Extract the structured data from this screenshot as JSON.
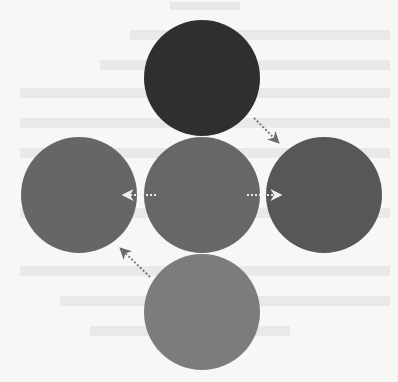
{
  "diagram": {
    "type": "color-mixing-node-diagram",
    "nodes": [
      {
        "id": "top",
        "cx": 202,
        "cy": 78,
        "r": 58,
        "color": "#2f2f2f"
      },
      {
        "id": "left",
        "cx": 79,
        "cy": 195,
        "r": 58,
        "color": "#666666"
      },
      {
        "id": "center",
        "cx": 202,
        "cy": 195,
        "r": 58,
        "color": "#676767"
      },
      {
        "id": "right",
        "cx": 324,
        "cy": 195,
        "r": 58,
        "color": "#575757"
      },
      {
        "id": "bottom",
        "cx": 202,
        "cy": 312,
        "r": 58,
        "color": "#7c7c7c"
      }
    ],
    "edges": [
      {
        "from": "top",
        "to": "right",
        "style": "dotted",
        "color": "#777777"
      },
      {
        "from": "center",
        "to": "left",
        "style": "dotted",
        "color": "#e8e8e8"
      },
      {
        "from": "center",
        "to": "right",
        "style": "dotted",
        "color": "#e8e8e8"
      },
      {
        "from": "bottom",
        "to": "left",
        "style": "dotted",
        "color": "#777777"
      }
    ],
    "background": "#f7f7f5"
  }
}
